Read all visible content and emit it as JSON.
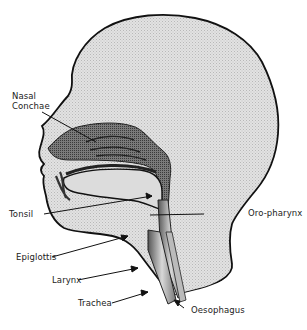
{
  "diagram": {
    "colors": {
      "skin_fill": "#dcdcdc",
      "outline": "#111111",
      "tissue_dark": "#5a5a5a",
      "tissue_mid": "#8a8a8a",
      "background": "#ffffff"
    },
    "labels": [
      {
        "id": "nasal-conchae",
        "line1": "Nasal",
        "line2": "Conchae"
      },
      {
        "id": "tonsil",
        "text": "Tonsil"
      },
      {
        "id": "epiglottis",
        "text": "Epiglottis"
      },
      {
        "id": "larynx",
        "text": "Larynx"
      },
      {
        "id": "trachea",
        "text": "Trachea"
      },
      {
        "id": "oro-pharynx",
        "text": "Oro-pharynx"
      },
      {
        "id": "oesophagus",
        "text": "Oesophagus"
      }
    ]
  }
}
